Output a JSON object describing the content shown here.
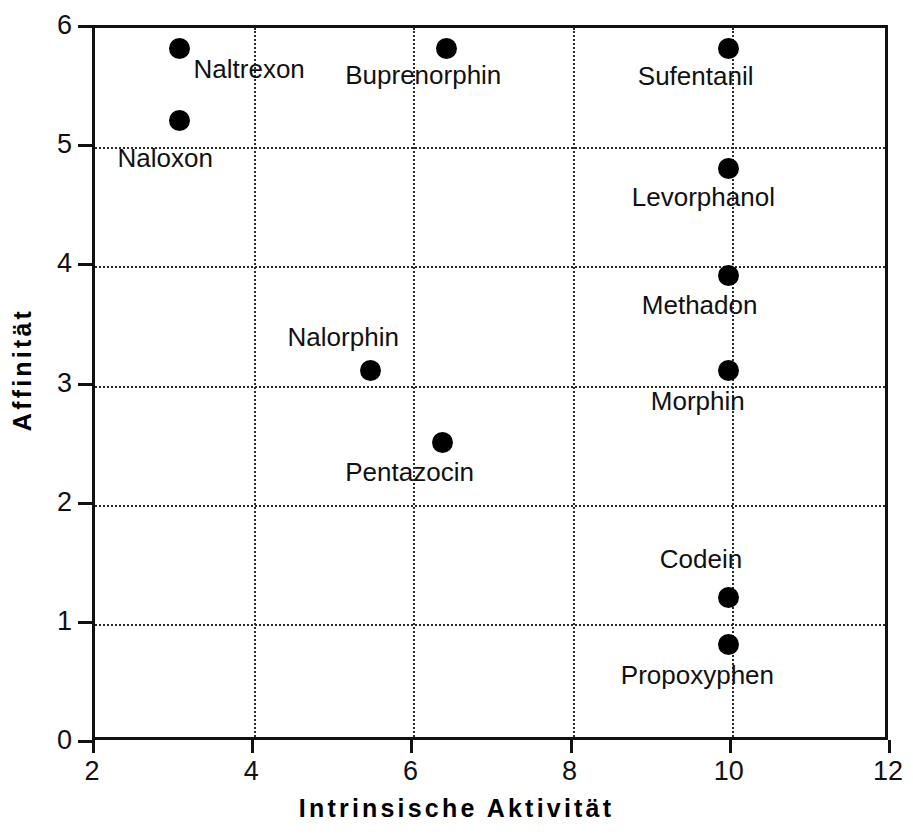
{
  "chart_data": {
    "type": "scatter",
    "title": "",
    "xlabel": "Intrinsische   Aktivität",
    "ylabel": "Affinität",
    "xlim": [
      2,
      12
    ],
    "ylim": [
      0,
      6
    ],
    "xticks": [
      "2",
      "4",
      "6",
      "8",
      "10",
      "12"
    ],
    "xtick_values": [
      2,
      4,
      6,
      8,
      10,
      12
    ],
    "yticks": [
      "0",
      "1",
      "2",
      "3",
      "4",
      "5",
      "6"
    ],
    "ytick_values": [
      0,
      1,
      2,
      3,
      4,
      5,
      6
    ],
    "grid": true,
    "grid_style": "dotted",
    "legend": "none",
    "marker": "filled-circle",
    "marker_color": "#000000",
    "points": [
      {
        "label": "Naltrexon",
        "x": 3.1,
        "y": 5.8,
        "label_dx": 14,
        "label_dy": 6
      },
      {
        "label": "Naloxon",
        "x": 3.1,
        "y": 5.2,
        "label_dx": -62,
        "label_dy": 24
      },
      {
        "label": "Buprenorphin",
        "x": 6.45,
        "y": 5.8,
        "label_dx": -101,
        "label_dy": 12
      },
      {
        "label": "Sufentanil",
        "x": 10.0,
        "y": 5.8,
        "label_dx": -91,
        "label_dy": 13
      },
      {
        "label": "Levorphanol",
        "x": 10.0,
        "y": 4.8,
        "label_dx": -97,
        "label_dy": 15
      },
      {
        "label": "Methadon",
        "x": 10.0,
        "y": 3.9,
        "label_dx": -87,
        "label_dy": 16
      },
      {
        "label": "Nalorphin",
        "x": 5.5,
        "y": 3.1,
        "label_dx": -83,
        "label_dy": -48
      },
      {
        "label": "Morphin",
        "x": 10.0,
        "y": 3.1,
        "label_dx": -78,
        "label_dy": 16
      },
      {
        "label": "Pentazocin",
        "x": 6.4,
        "y": 2.5,
        "label_dx": -97,
        "label_dy": 16
      },
      {
        "label": "Codein",
        "x": 10.0,
        "y": 1.2,
        "label_dx": -69,
        "label_dy": -52
      },
      {
        "label": "Propoxyphen",
        "x": 10.0,
        "y": 0.8,
        "label_dx": -108,
        "label_dy": 16
      }
    ]
  },
  "axes": {
    "x_title": "Intrinsische   Aktivität",
    "y_title": "Affinität"
  }
}
